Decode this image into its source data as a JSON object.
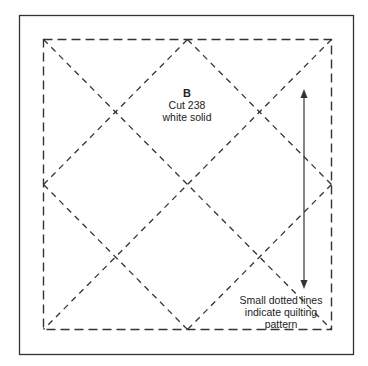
{
  "block": {
    "letter": "B",
    "cut": "Cut 238",
    "fabric": "white solid"
  },
  "note": {
    "line1": "Small dotted lines",
    "line2": "indicate quilting",
    "line3": "pattern"
  },
  "colors": {
    "line": "#333333",
    "background": "#ffffff"
  }
}
